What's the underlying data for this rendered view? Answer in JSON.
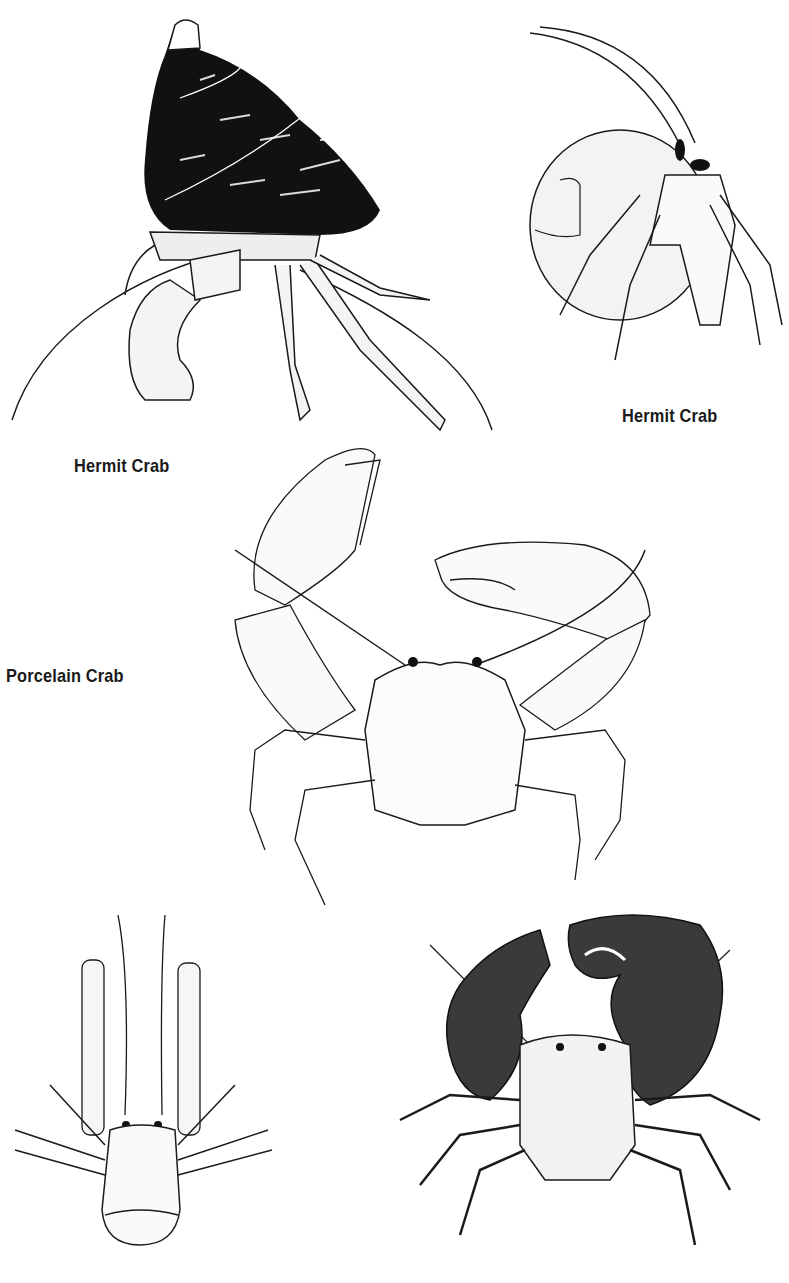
{
  "page": {
    "background": "#ffffff",
    "ink_color": "#1a1a1a"
  },
  "labels": {
    "hermit_crab_left": "Hermit Crab",
    "hermit_crab_right": "Hermit Crab",
    "porcelain_crab": "Porcelain Crab"
  },
  "illustrations": [
    {
      "id": "hermit-crab-dark-shell",
      "caption_key": "hermit_crab_left"
    },
    {
      "id": "hermit-crab-round-shell",
      "caption_key": "hermit_crab_right"
    },
    {
      "id": "porcelain-crab-large-claws",
      "caption_key": "porcelain_crab"
    },
    {
      "id": "hermit-crab-dorsal-view",
      "caption_key": null
    },
    {
      "id": "crab-dark-textured-claws",
      "caption_key": null
    }
  ]
}
